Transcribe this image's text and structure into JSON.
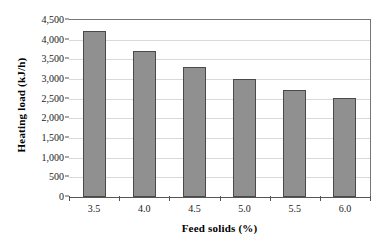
{
  "chart_data": {
    "type": "bar",
    "title": "",
    "xlabel": "Feed solids (%)",
    "ylabel": "Heating load  (kJ/h)",
    "categories": [
      "3.5",
      "4.0",
      "4.5",
      "5.0",
      "5.5",
      "6.0"
    ],
    "values": [
      4230,
      3700,
      3300,
      3000,
      2720,
      2520
    ],
    "series": [
      {
        "name": "Heating load",
        "values": [
          4230,
          3700,
          3300,
          3000,
          2720,
          2520
        ]
      }
    ],
    "ylim": [
      0,
      4500
    ],
    "y_tick_values": [
      0,
      500,
      1000,
      1500,
      2000,
      2500,
      3000,
      3500,
      4000,
      4500
    ],
    "y_tick_labels": [
      "0",
      "500",
      "1,000",
      "1,500",
      "2,000",
      "2,500",
      "3,000",
      "3,500",
      "4,000",
      "4,500"
    ],
    "grid": "horizontal",
    "legend": "none",
    "bar_color": "#909090",
    "bar_border_color": "#4a4a4a",
    "gridline_color": "#d9d9d9",
    "axis_color": "#555555",
    "background_color": "#ffffff"
  }
}
